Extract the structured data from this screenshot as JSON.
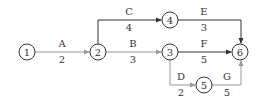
{
  "diagram": {
    "type": "activity-on-arrow network",
    "nodes": [
      {
        "id": "1",
        "label": "1",
        "x": 27,
        "y": 52
      },
      {
        "id": "2",
        "label": "2",
        "x": 98,
        "y": 52
      },
      {
        "id": "3",
        "label": "3",
        "x": 170,
        "y": 52
      },
      {
        "id": "4",
        "label": "4",
        "x": 170,
        "y": 20
      },
      {
        "id": "5",
        "label": "5",
        "x": 204,
        "y": 85
      },
      {
        "id": "6",
        "label": "6",
        "x": 240,
        "y": 52
      }
    ],
    "activities": [
      {
        "name": "A",
        "duration": "2",
        "from": "1",
        "to": "2"
      },
      {
        "name": "B",
        "duration": "3",
        "from": "2",
        "to": "3"
      },
      {
        "name": "C",
        "duration": "4",
        "from": "2",
        "to": "4"
      },
      {
        "name": "D",
        "duration": "2",
        "from": "3",
        "to": "5"
      },
      {
        "name": "E",
        "duration": "3",
        "from": "4",
        "to": "6"
      },
      {
        "name": "F",
        "duration": "5",
        "from": "3",
        "to": "6"
      },
      {
        "name": "G",
        "duration": "5",
        "from": "5",
        "to": "6"
      }
    ]
  }
}
